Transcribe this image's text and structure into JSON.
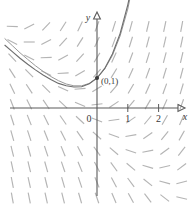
{
  "figure": {
    "title": "",
    "background_color": "#ffffff",
    "width": 194,
    "height": 206
  },
  "axes": {
    "x_axis_label": "x",
    "y_axis_label": "y",
    "origin_label": "0",
    "x_tick_labels": [
      "1",
      "2"
    ],
    "axis_color": "#5a5a5a"
  },
  "annotations": {
    "initial_point_label": "(0,1)"
  },
  "chart_data": {
    "type": "line",
    "title": "",
    "subtitle": "",
    "xlabel": "x",
    "ylabel": "y",
    "xlim": [
      -3.2,
      3.2
    ],
    "ylim": [
      -3.2,
      3.4
    ],
    "grid": false,
    "legend": "none",
    "equation": "dy/dx = x + y",
    "solution_expression": "y = 2e^x - x - 1",
    "initial_condition": {
      "x": 0,
      "y": 1,
      "label": "(0,1)"
    },
    "x_ticks": [
      0,
      1,
      2
    ],
    "x_tick_labels": [
      "0",
      "1",
      "2"
    ],
    "y_ticks": [],
    "y_tick_labels": [],
    "series": [
      {
        "name": "solution curve through (0,1)",
        "color": "#6e6e6e",
        "x": [
          -3.0,
          -2.75,
          -2.5,
          -2.25,
          -2.0,
          -1.75,
          -1.5,
          -1.25,
          -1.0,
          -0.75,
          -0.5,
          -0.25,
          0.0,
          0.25,
          0.5,
          0.75,
          1.0,
          1.15
        ],
        "y": [
          2.1,
          1.88,
          1.66,
          1.46,
          1.27,
          1.1,
          0.95,
          0.82,
          0.74,
          0.7,
          0.71,
          0.81,
          1.0,
          1.32,
          1.8,
          2.48,
          3.44,
          4.16
        ]
      },
      {
        "name": "solution curve second branch",
        "color": "#9a9a9a",
        "x": [
          -3.0,
          -2.75,
          -2.5,
          -2.25,
          -2.0,
          -1.75,
          -1.5,
          -1.25,
          -1.0,
          -0.75,
          -0.5,
          -0.25,
          0.0,
          0.25,
          0.5,
          0.75,
          1.0,
          1.1
        ],
        "y": [
          2.32,
          2.08,
          1.84,
          1.62,
          1.41,
          1.22,
          1.05,
          0.91,
          0.8,
          0.74,
          0.74,
          0.82,
          1.0,
          1.3,
          1.75,
          2.4,
          3.3,
          3.8
        ]
      }
    ],
    "slope_field": {
      "description": "short line segments showing direction field of dy/dx = x + y",
      "color": "#b4b4b4",
      "x_range": [
        -2.75,
        2.75
      ],
      "y_range": [
        -3.0,
        3.0
      ],
      "x_step": 0.55,
      "y_step": 0.52,
      "segment_length_px": 11
    }
  }
}
